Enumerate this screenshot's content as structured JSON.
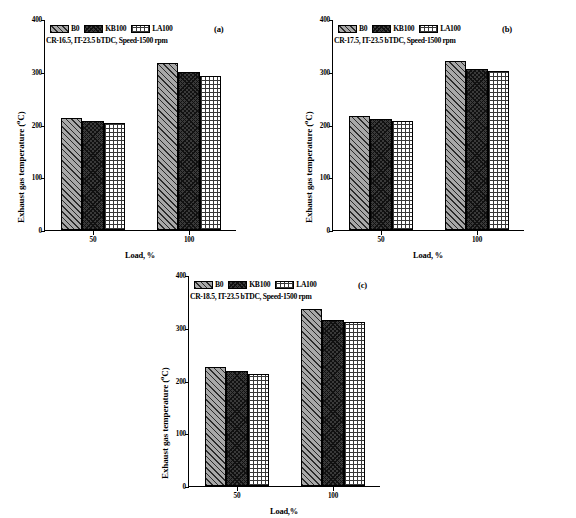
{
  "figure": {
    "series_names": [
      "B0",
      "KB100",
      "LA100"
    ],
    "categories": [
      "50",
      "100"
    ],
    "ylabel_text": "Exhaust gas temperature (",
    "ylabel_sup": "o",
    "ylabel_tail": "C)",
    "yticks": [
      "0",
      "100",
      "200",
      "300",
      "400"
    ],
    "ylim": [
      0,
      400
    ]
  },
  "panels": [
    {
      "tag": "(a)",
      "annotation": "CR-16.5, IT-23.5 bTDC, Speed-1500 rpm",
      "xlabel": "Load, %",
      "legend": [
        "B0",
        "KB100",
        "LA100"
      ],
      "xticks": [
        "50",
        "100"
      ]
    },
    {
      "tag": "(b)",
      "annotation": "CR-17.5, IT-23.5 bTDC, Speed-1500 rpm",
      "xlabel": "Load, %",
      "legend": [
        "B0",
        "KB100",
        "LA100"
      ],
      "xticks": [
        "50",
        "100"
      ]
    },
    {
      "tag": "(c)",
      "annotation": "CR-18.5, IT-23.5 bTDC, Speed-1500 rpm",
      "xlabel": "Load,%",
      "legend": [
        "B0",
        "KB100",
        "LA100"
      ],
      "xticks": [
        "50",
        "100"
      ]
    }
  ],
  "chart_data": [
    {
      "type": "bar",
      "panel": "(a)",
      "title": "CR-16.5, IT-23.5 bTDC, Speed-1500 rpm",
      "categories": [
        "50",
        "100"
      ],
      "series": [
        {
          "name": "B0",
          "values": [
            212,
            317
          ]
        },
        {
          "name": "KB100",
          "values": [
            206,
            299
          ]
        },
        {
          "name": "LA100",
          "values": [
            202,
            292
          ]
        }
      ],
      "xlabel": "Load, %",
      "ylabel": "Exhaust gas temperature (oC)",
      "ylim": [
        0,
        400
      ],
      "yticks": [
        0,
        100,
        200,
        300,
        400
      ],
      "grid": false,
      "legend_position": "top-left"
    },
    {
      "type": "bar",
      "panel": "(b)",
      "title": "CR-17.5, IT-23.5 bTDC, Speed-1500 rpm",
      "categories": [
        "50",
        "100"
      ],
      "series": [
        {
          "name": "B0",
          "values": [
            217,
            321
          ]
        },
        {
          "name": "KB100",
          "values": [
            211,
            305
          ]
        },
        {
          "name": "LA100",
          "values": [
            206,
            301
          ]
        }
      ],
      "xlabel": "Load, %",
      "ylabel": "Exhaust gas temperature (oC)",
      "ylim": [
        0,
        400
      ],
      "yticks": [
        0,
        100,
        200,
        300,
        400
      ],
      "grid": false,
      "legend_position": "top-left"
    },
    {
      "type": "bar",
      "panel": "(c)",
      "title": "CR-18.5, IT-23.5 bTDC, Speed-1500 rpm",
      "categories": [
        "50",
        "100"
      ],
      "series": [
        {
          "name": "B0",
          "values": [
            225,
            335
          ]
        },
        {
          "name": "KB100",
          "values": [
            218,
            314
          ]
        },
        {
          "name": "LA100",
          "values": [
            213,
            310
          ]
        }
      ],
      "xlabel": "Load,%",
      "ylabel": "Exhaust gas temperature (oC)",
      "ylim": [
        0,
        400
      ],
      "yticks": [
        0,
        100,
        200,
        300,
        400
      ],
      "grid": false,
      "legend_position": "top-left"
    }
  ]
}
